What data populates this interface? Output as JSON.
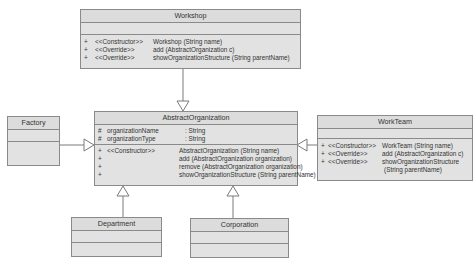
{
  "classes": {
    "workshop": {
      "name": "Workshop",
      "methods": [
        {
          "vis": "+",
          "stereo": "<<Constructor>>",
          "sig": "Workshop (String name)"
        },
        {
          "vis": "+",
          "stereo": "<<Override>>",
          "sig": "add (AbstractOrganization c)"
        },
        {
          "vis": "+",
          "stereo": "<<Override>>",
          "sig": "showOrganizationStructure (String parentName)"
        }
      ]
    },
    "abstract": {
      "name": "AbstractOrganization",
      "attributes": [
        {
          "vis": "#",
          "name": "organizationName",
          "type": ": String"
        },
        {
          "vis": "#",
          "name": "organizationType",
          "type": ": String"
        }
      ],
      "methods": [
        {
          "vis": "+",
          "stereo": "<<Constructor>>",
          "sig": "AbstractOrganization (String name)"
        },
        {
          "vis": "+",
          "stereo": "",
          "sig": "add (AbstractOrganization organization)"
        },
        {
          "vis": "+",
          "stereo": "",
          "sig": "remove (AbstractOrganization organization)"
        },
        {
          "vis": "+",
          "stereo": "",
          "sig": "showOrganizationStructure (String parentName)"
        }
      ]
    },
    "factory": {
      "name": "Factory"
    },
    "workteam": {
      "name": "WorkTeam",
      "methods": [
        {
          "vis": "+",
          "stereo": "<<Constructor>>",
          "sig": "WorkTeam (String name)"
        },
        {
          "vis": "+",
          "stereo": "<<Override>>",
          "sig": "add (AbstractOrganization c)"
        },
        {
          "vis": "+",
          "stereo": "<<Override>>",
          "sig": "showOrganizationStructure"
        },
        {
          "vis": "",
          "stereo": "",
          "sig": "(String parentName)"
        }
      ]
    },
    "department": {
      "name": "Department"
    },
    "corporation": {
      "name": "Corporation"
    }
  },
  "relations": [
    {
      "type": "generalization",
      "from": "Workshop",
      "to": "AbstractOrganization"
    },
    {
      "type": "generalization",
      "from": "Factory",
      "to": "AbstractOrganization"
    },
    {
      "type": "generalization",
      "from": "WorkTeam",
      "to": "AbstractOrganization"
    },
    {
      "type": "generalization",
      "from": "Department",
      "to": "AbstractOrganization"
    },
    {
      "type": "generalization",
      "from": "Corporation",
      "to": "AbstractOrganization"
    }
  ],
  "colors": {
    "fill": "#e2e2e2",
    "border": "#8a8a8a",
    "line": "#7a7a7a"
  }
}
